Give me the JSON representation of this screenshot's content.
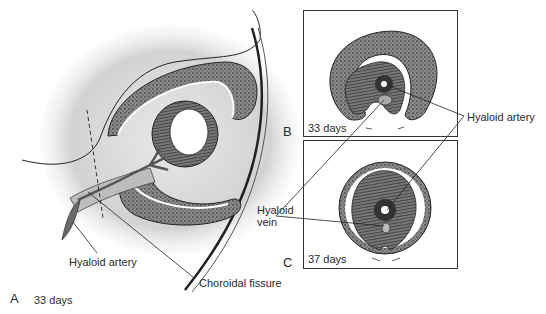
{
  "figure": {
    "panels": [
      {
        "id": "A",
        "letter": "A",
        "age": "33 days"
      },
      {
        "id": "B",
        "letter": "B",
        "age": "33 days"
      },
      {
        "id": "C",
        "letter": "C",
        "age": "37 days"
      }
    ],
    "labels": {
      "hyaloid_artery_left": "Hyaloid artery",
      "choroidal_fissure": "Choroidal fissure",
      "hyaloid_artery_right": "Hyaloid artery",
      "hyaloid_vein_line1": "Hyaloid",
      "hyaloid_vein_line2": "vein"
    }
  }
}
